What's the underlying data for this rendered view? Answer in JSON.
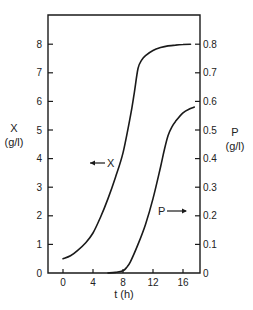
{
  "chart_data": {
    "type": "line",
    "title": "",
    "xlabel": "t (h)",
    "ylabel_left": "X",
    "ylabel_left_unit": "(g/l)",
    "ylabel_right": "P",
    "ylabel_right_unit": "(g/l)",
    "xlim": [
      -2,
      18
    ],
    "ylim_left": [
      0,
      9
    ],
    "ylim_right": [
      0,
      0.9
    ],
    "x_ticks": [
      0,
      4,
      8,
      12,
      16
    ],
    "x_tick_labels": [
      "0",
      "4",
      "8",
      "12",
      "16"
    ],
    "y_left_ticks": [
      0,
      1,
      2,
      3,
      4,
      5,
      6,
      7,
      8
    ],
    "y_left_tick_labels": [
      "0",
      "1",
      "2",
      "3",
      "4",
      "5",
      "6",
      "7",
      "8"
    ],
    "y_right_ticks": [
      0,
      0.1,
      0.2,
      0.3,
      0.4,
      0.5,
      0.6,
      0.7,
      0.8
    ],
    "y_right_tick_labels": [
      "0",
      "0.1",
      "0.2",
      "0.3",
      "0.4",
      "0.5",
      "0.6",
      "0.7",
      "0.8"
    ],
    "grid": false,
    "legend": "inline annotations (arrows pointing to respective axis)",
    "series": [
      {
        "name": "X",
        "axis": "left",
        "annotation": "←X",
        "x": [
          0,
          1,
          2,
          3,
          4,
          5,
          6,
          7,
          8,
          9,
          9.5,
          10,
          10.5,
          11,
          12,
          13,
          14,
          15,
          16,
          17
        ],
        "values": [
          0.5,
          0.6,
          0.8,
          1.05,
          1.4,
          1.95,
          2.6,
          3.35,
          4.2,
          5.5,
          6.3,
          7.15,
          7.45,
          7.6,
          7.78,
          7.88,
          7.94,
          7.97,
          7.99,
          8.0
        ]
      },
      {
        "name": "P",
        "axis": "right",
        "annotation": "P→",
        "x": [
          6,
          7,
          8,
          8.5,
          9,
          10,
          11,
          12,
          13,
          13.5,
          14,
          14.5,
          15,
          16,
          17,
          17.5
        ],
        "values": [
          0.0,
          0.002,
          0.008,
          0.02,
          0.04,
          0.1,
          0.17,
          0.26,
          0.37,
          0.43,
          0.48,
          0.51,
          0.53,
          0.56,
          0.575,
          0.58
        ]
      }
    ]
  }
}
